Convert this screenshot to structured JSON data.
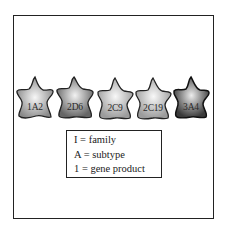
{
  "diagram": {
    "shapes": [
      {
        "label": "1A2",
        "fill_center": "#f4f4f4",
        "fill_edge": "#8a8a8a",
        "x": 16
      },
      {
        "label": "2D6",
        "fill_center": "#eeeeee",
        "fill_edge": "#6a6a6a",
        "x": 56
      },
      {
        "label": "2C9",
        "fill_center": "#f6f6f6",
        "fill_edge": "#9a9a9a",
        "x": 96
      },
      {
        "label": "2C19",
        "fill_center": "#f6f6f6",
        "fill_edge": "#9a9a9a",
        "x": 134
      },
      {
        "label": "3A4",
        "fill_center": "#e8e8e8",
        "fill_edge": "#3e3e3e",
        "x": 172
      }
    ],
    "legend": {
      "lines": [
        "I = family",
        "A = subtype",
        "1 = gene product"
      ]
    }
  }
}
